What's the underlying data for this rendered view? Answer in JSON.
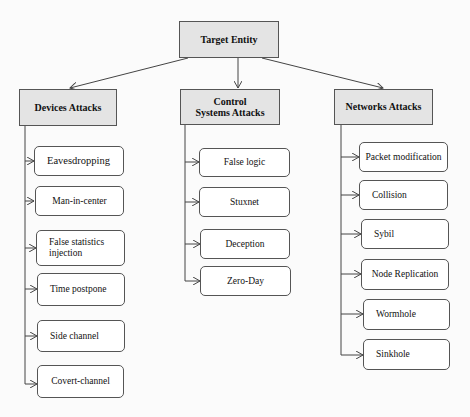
{
  "root": {
    "label": "Target Entity"
  },
  "categories": [
    {
      "label": "Devices Attacks",
      "items": [
        "Eavesdropping",
        "Man-in-center",
        "False statistics injection",
        "Time postpone",
        "Side channel",
        "Covert-channel"
      ]
    },
    {
      "label": "Control Systems Attacks",
      "items": [
        "False logic",
        "Stuxnet",
        "Deception",
        "Zero-Day"
      ]
    },
    {
      "label": "Networks Attacks",
      "items": [
        "Packet modification",
        "Collision",
        "Sybil",
        "Node Replication",
        "Wormhole",
        "Sinkhole"
      ]
    }
  ],
  "colors": {
    "header_fill": "#e4e4e4",
    "leaf_fill": "#ffffff",
    "line": "#444444"
  }
}
